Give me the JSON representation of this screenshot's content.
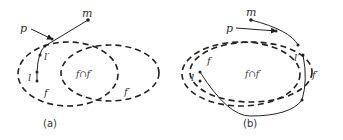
{
  "panels": [
    {
      "id": "a",
      "caption": "(a)",
      "labels": {
        "m": "m",
        "p": "p",
        "l_prime": "l′",
        "l": "l",
        "f": "f",
        "f_prime": "f′",
        "intersection": "f∩f′"
      }
    },
    {
      "id": "b",
      "caption": "(b)",
      "labels": {
        "m": "m",
        "p": "p",
        "l_prime": "l′",
        "l": "l",
        "f": "f",
        "f_prime": "f′",
        "intersection": "f∩f′"
      }
    }
  ],
  "colors": {
    "stroke": "#222222",
    "text": "#333333",
    "background": "#ffffff"
  }
}
